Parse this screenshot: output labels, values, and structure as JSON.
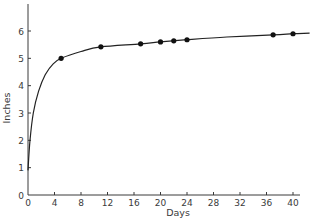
{
  "chart_data": {
    "type": "line",
    "title": "",
    "xlabel": "Days",
    "ylabel": "Inches",
    "xlim": [
      0,
      40
    ],
    "ylim": [
      0,
      6.5
    ],
    "x_ticks": [
      0,
      4,
      8,
      12,
      16,
      20,
      24,
      28,
      32,
      36,
      40
    ],
    "y_ticks": [
      0,
      1,
      2,
      3,
      4,
      5,
      6
    ],
    "grid": false,
    "legend": null,
    "series": [
      {
        "name": "measured",
        "marker": "filled-circle",
        "points": [
          {
            "x": 5,
            "y": 5.0
          },
          {
            "x": 11,
            "y": 5.42
          },
          {
            "x": 17,
            "y": 5.53
          },
          {
            "x": 20,
            "y": 5.6
          },
          {
            "x": 22,
            "y": 5.64
          },
          {
            "x": 24,
            "y": 5.68
          },
          {
            "x": 37,
            "y": 5.86
          },
          {
            "x": 40,
            "y": 5.9
          }
        ]
      },
      {
        "name": "fitted-curve",
        "marker": "none",
        "points": [
          {
            "x": 0,
            "y": 0.9
          },
          {
            "x": 0.3,
            "y": 2.0
          },
          {
            "x": 0.8,
            "y": 3.0
          },
          {
            "x": 1.6,
            "y": 3.8
          },
          {
            "x": 2.6,
            "y": 4.4
          },
          {
            "x": 3.8,
            "y": 4.8
          },
          {
            "x": 5,
            "y": 5.0
          },
          {
            "x": 8,
            "y": 5.25
          },
          {
            "x": 11,
            "y": 5.42
          },
          {
            "x": 17,
            "y": 5.53
          },
          {
            "x": 20,
            "y": 5.6
          },
          {
            "x": 24,
            "y": 5.68
          },
          {
            "x": 30,
            "y": 5.78
          },
          {
            "x": 37,
            "y": 5.86
          },
          {
            "x": 40,
            "y": 5.9
          },
          {
            "x": 42.5,
            "y": 5.92
          }
        ]
      }
    ]
  },
  "style": {
    "axis_color": "#3a3a3a",
    "line_color": "#222222",
    "marker_color": "#111111"
  }
}
